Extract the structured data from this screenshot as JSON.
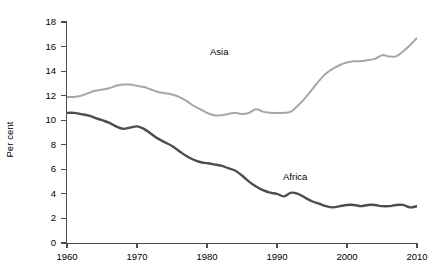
{
  "chart_data": {
    "type": "line",
    "title": "",
    "xlabel": "",
    "ylabel": "Per cent",
    "xlim": [
      1960,
      2010
    ],
    "ylim": [
      0,
      18
    ],
    "xticks": [
      1960,
      1970,
      1980,
      1990,
      2000,
      2010
    ],
    "yticks": [
      0,
      2,
      4,
      6,
      8,
      10,
      12,
      14,
      16,
      18
    ],
    "grid": false,
    "legend_position": "inline-annotation",
    "annotations": [
      {
        "text": "Asia",
        "x": 1982,
        "y": 14.6
      },
      {
        "text": "Africa",
        "x": 1992.5,
        "y": 4.6
      }
    ],
    "x": [
      1960,
      1961,
      1962,
      1963,
      1964,
      1965,
      1966,
      1967,
      1968,
      1969,
      1970,
      1971,
      1972,
      1973,
      1974,
      1975,
      1976,
      1977,
      1978,
      1979,
      1980,
      1981,
      1982,
      1983,
      1984,
      1985,
      1986,
      1987,
      1988,
      1989,
      1990,
      1991,
      1992,
      1993,
      1994,
      1995,
      1996,
      1997,
      1998,
      1999,
      2000,
      2001,
      2002,
      2003,
      2004,
      2005,
      2006,
      2007,
      2008,
      2009
    ],
    "series": [
      {
        "name": "Asia",
        "color": "#a6a6a6",
        "values": [
          11.9,
          11.9,
          12.0,
          12.2,
          12.4,
          12.5,
          12.6,
          12.8,
          12.9,
          12.9,
          12.8,
          12.7,
          12.5,
          12.3,
          12.2,
          12.1,
          11.9,
          11.6,
          11.2,
          10.9,
          10.6,
          10.4,
          10.4,
          10.5,
          10.6,
          10.5,
          10.6,
          10.9,
          10.7,
          10.6,
          10.6,
          10.6,
          10.7,
          11.2,
          11.8,
          12.5,
          13.2,
          13.8,
          14.2,
          14.5,
          14.7,
          14.8,
          14.8,
          14.9,
          15.0,
          15.3,
          15.2,
          15.2,
          15.6,
          16.1
        ],
        "last_value": 16.7
      },
      {
        "name": "Africa",
        "color": "#4d4d4d",
        "values": [
          10.6,
          10.6,
          10.5,
          10.4,
          10.2,
          10.0,
          9.8,
          9.5,
          9.3,
          9.4,
          9.5,
          9.3,
          8.9,
          8.5,
          8.2,
          7.9,
          7.5,
          7.1,
          6.8,
          6.6,
          6.5,
          6.4,
          6.3,
          6.1,
          5.9,
          5.5,
          5.0,
          4.6,
          4.3,
          4.1,
          4.0,
          3.8,
          4.1,
          4.0,
          3.7,
          3.4,
          3.2,
          3.0,
          2.9,
          3.0,
          3.1,
          3.1,
          3.0,
          3.1,
          3.1,
          3.0,
          3.0,
          3.1,
          3.1,
          2.9
        ],
        "last_value": 3.0
      }
    ]
  }
}
